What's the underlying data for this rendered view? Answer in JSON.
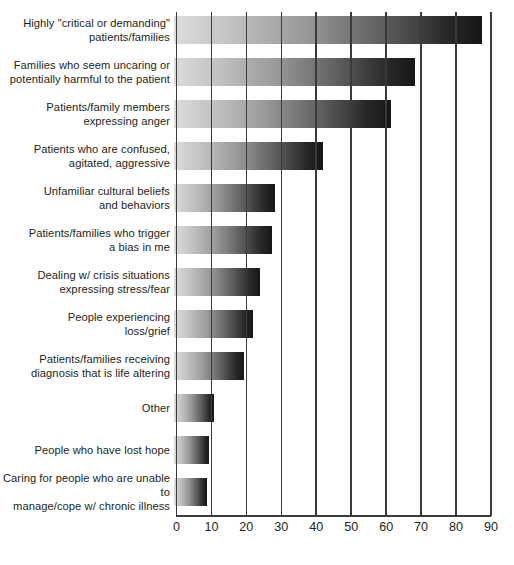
{
  "chart_data": {
    "type": "bar",
    "orientation": "horizontal",
    "title": "",
    "subtitle": "",
    "xlabel": "",
    "ylabel": "",
    "xlim": [
      0,
      90
    ],
    "xticks": [
      0,
      10,
      20,
      30,
      40,
      50,
      60,
      70,
      80,
      90
    ],
    "grid": "vertical",
    "legend": "none",
    "categories": [
      "Highly \"critical or demanding\"\npatients/families",
      "Families who seem uncaring or\npotentially harmful to the patient",
      "Patients/family members\nexpressing anger",
      "Patients who are confused,\nagitated, aggressive",
      "Unfamiliar cultural beliefs\nand behaviors",
      "Patients/families who trigger\na bias in me",
      "Dealing w/ crisis situations\nexpressing stress/fear",
      "People experiencing\nloss/grief",
      "Patients/families receiving\ndiagnosis that is life altering",
      "Other",
      "People who have lost hope",
      "Caring for people who are unable to\nmanage/cope w/ chronic illness"
    ],
    "values": [
      88,
      69,
      62,
      42.5,
      29,
      28,
      24.5,
      22.5,
      20,
      11.5,
      10,
      9.5
    ],
    "bar_gradient": {
      "from": "#dcdcdc",
      "to": "#161616"
    },
    "axis_color": "#3a3a3a",
    "text_color": "#231f20",
    "background": "#ffffff"
  }
}
